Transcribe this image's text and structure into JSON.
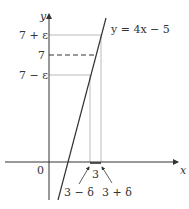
{
  "diagram": {
    "y_axis_label": "y",
    "x_axis_label": "x",
    "origin_label": "0",
    "line_label": "y = 4x − 5",
    "y_ticks": {
      "upper": "7 + ε",
      "center": "7",
      "lower": "7 − ε"
    },
    "x_ticks": {
      "center": "3",
      "left": "3 − δ",
      "right": "3 + δ"
    },
    "colors": {
      "axis": "#333333",
      "line": "#333333",
      "guide": "#aaaaaa",
      "background": "#ffffff"
    }
  }
}
